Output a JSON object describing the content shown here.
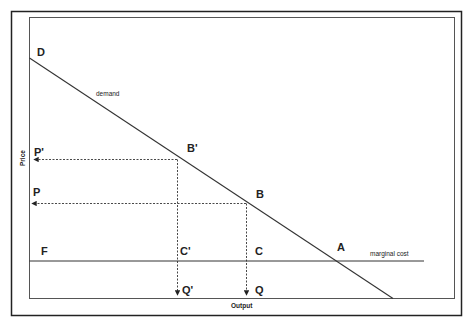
{
  "diagram": {
    "type": "economics-monopoly-pricing",
    "axes": {
      "x_label": "Output",
      "y_label": "Price"
    },
    "curves": {
      "demand": {
        "label": "demand",
        "from": "D",
        "to": "axis-x"
      },
      "marginal_cost": {
        "label": "marginal cost",
        "style": "horizontal"
      }
    },
    "points": {
      "D": "D",
      "B_prime": "B'",
      "B": "B",
      "A": "A",
      "F": "F",
      "C_prime": "C'",
      "C": "C",
      "P_prime": "P'",
      "P": "P",
      "Q_prime": "Q'",
      "Q": "Q"
    },
    "colors": {
      "line": "#333333",
      "frame": "#222222",
      "background": "#ffffff"
    }
  }
}
